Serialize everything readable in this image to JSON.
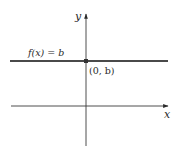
{
  "figure": {
    "type": "function-graph",
    "axes": {
      "x_label": "x",
      "y_label": "y"
    },
    "function_label": "f(x) = b",
    "point_label": "(0, b)",
    "colors": {
      "axis": "#3a3a3a",
      "function_line": "#4a4a4a",
      "point": "#333333",
      "text": "#2a2a2a",
      "background": "#ffffff"
    }
  }
}
